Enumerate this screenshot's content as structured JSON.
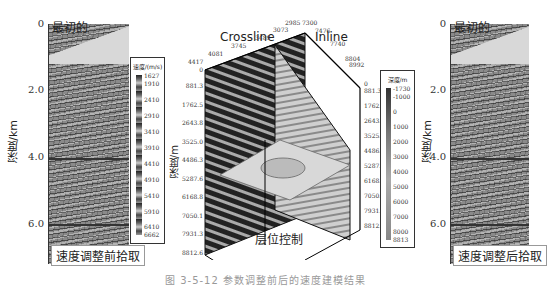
{
  "figure": {
    "caption": "图 3-5-12  参数调整前后的速度建模结果"
  },
  "left_panel": {
    "corner_label": "最初的",
    "bottom_label": "速度调整前拾取",
    "y_axis_title": "深度/km",
    "y_ticks": [
      "0",
      "2.0",
      "4.0",
      "6.0"
    ]
  },
  "right_panel": {
    "corner_label": "最初的",
    "bottom_label": "速度调整后拾取",
    "y_axis_title": "深度/km",
    "y_ticks": [
      "0",
      "2.0",
      "4.0",
      "6.0"
    ]
  },
  "velocity_legend": {
    "title": "速度/(m/s)",
    "ticks": [
      "1627",
      "1910",
      "2410",
      "2910",
      "3410",
      "3910",
      "4410",
      "4910",
      "5410",
      "5910",
      "6410",
      "6662"
    ]
  },
  "depth_legend": {
    "title": "深度/m",
    "ticks": [
      "-1730",
      "-1000",
      "0",
      "1000",
      "2000",
      "3000",
      "4000",
      "5000",
      "6000",
      "7000",
      "8000",
      "8813"
    ]
  },
  "cube": {
    "crossline_title": "Crossline",
    "inline_title": "Inline",
    "horizon_label": "层位控制",
    "left_axis_title": "深度/m",
    "crossline_ticks": [
      "4417",
      "4081",
      "3745",
      "3489",
      "3073",
      "2985"
    ],
    "inline_ticks": [
      "7300",
      "7476",
      "7740",
      "8804",
      "8992"
    ],
    "left_depth_ticks": [
      "0",
      "881.3",
      "1762.5",
      "2643.8",
      "3525.0",
      "4486.3",
      "5287.6",
      "6168.8",
      "7050.1",
      "7931.3",
      "8812.6"
    ],
    "right_depth_ticks": [
      "0",
      "881.3",
      "1762.5",
      "2643.8",
      "3525.0",
      "4486.3",
      "5287.6",
      "6168.8",
      "7050.1",
      "7931.3",
      "8812.6"
    ]
  }
}
